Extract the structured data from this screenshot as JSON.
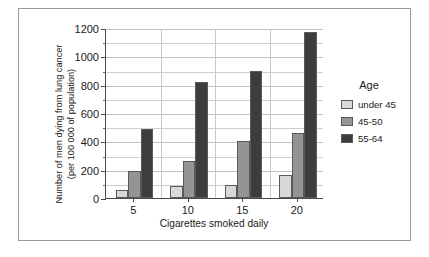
{
  "chart_data": {
    "type": "bar",
    "title": "",
    "xlabel": "Cigarettes smoked daily",
    "ylabel_line1": "Number of men dying from lung cancer",
    "ylabel_line2": "(per 100 000 of population)",
    "categories": [
      "5",
      "10",
      "15",
      "20"
    ],
    "series": [
      {
        "name": "under 45",
        "color": "#d8d8d8",
        "values": [
          55,
          85,
          90,
          160
        ]
      },
      {
        "name": "45-50",
        "color": "#949494",
        "values": [
          190,
          260,
          400,
          460
        ]
      },
      {
        "name": "55-64",
        "color": "#3d3d3d",
        "values": [
          490,
          820,
          900,
          1170
        ]
      }
    ],
    "ylim": [
      0,
      1200
    ],
    "ymajor_ticks": [
      0,
      200,
      400,
      600,
      800,
      1000,
      1200
    ],
    "yminor_step": 100,
    "ytick_labels": [
      "0",
      "200",
      "400",
      "600",
      "800",
      "1000",
      "1200"
    ],
    "grid": true,
    "legend_position": "right",
    "legend_title": "Age"
  }
}
